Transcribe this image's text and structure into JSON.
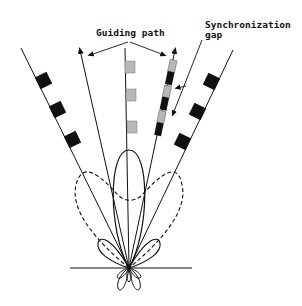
{
  "diagram": {
    "labels": {
      "guiding_path": "Guiding path",
      "sync_gap_line1": "Synchronization",
      "sync_gap_line2": "gap"
    },
    "colors": {
      "line": "#111111",
      "block_dark": "#111111",
      "block_light": "#b8b8b8",
      "background": "#ffffff"
    },
    "elements": [
      "ground-line",
      "left-outer-block-path",
      "right-outer-block-path",
      "left-guiding-arrow",
      "center-beam-line",
      "right-guiding-track",
      "main-lobe",
      "dashed-wide-lobe",
      "side-lobes",
      "back-lobes"
    ]
  }
}
